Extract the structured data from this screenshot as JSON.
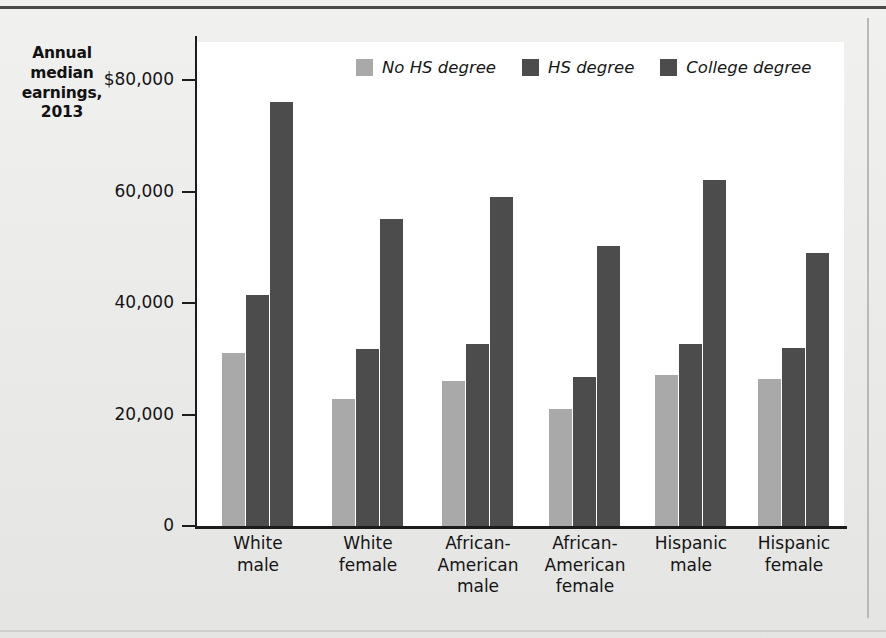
{
  "axis_title": "Annual median earnings, 2013",
  "axis_title_lines": [
    "Annual",
    "median",
    "earnings,",
    "2013"
  ],
  "colors": {
    "no_hs": "#a9a9a9",
    "hs": "#4c4c4c",
    "college": "#4c4c4c",
    "axis": "#1c1c1c",
    "panel": "#ffffff",
    "page": "#e9e9e7"
  },
  "legend": {
    "items": [
      {
        "label": "No HS degree",
        "color": "#a9a9a9"
      },
      {
        "label": "HS degree",
        "color": "#4c4c4c"
      },
      {
        "label": "College degree",
        "color": "#4c4c4c"
      }
    ]
  },
  "y_axis": {
    "ticks": [
      {
        "value": 80000,
        "label": "$80,000"
      },
      {
        "value": 60000,
        "label": "60,000"
      },
      {
        "value": 40000,
        "label": "40,000"
      },
      {
        "value": 20000,
        "label": "20,000"
      },
      {
        "value": 0,
        "label": "0"
      }
    ],
    "min": 0,
    "max": 80000
  },
  "x_axis": {
    "categories": [
      {
        "lines": [
          "White",
          "male"
        ]
      },
      {
        "lines": [
          "White",
          "female"
        ]
      },
      {
        "lines": [
          "African-",
          "American",
          "male"
        ]
      },
      {
        "lines": [
          "African-",
          "American",
          "female"
        ]
      },
      {
        "lines": [
          "Hispanic",
          "male"
        ]
      },
      {
        "lines": [
          "Hispanic",
          "female"
        ]
      }
    ]
  },
  "chart_data": {
    "type": "bar",
    "title": "",
    "xlabel": "",
    "ylabel": "Annual median earnings, 2013",
    "ylim": [
      0,
      80000
    ],
    "grid": false,
    "legend_position": "top-center",
    "categories": [
      "White male",
      "White female",
      "African-American male",
      "African-American female",
      "Hispanic male",
      "Hispanic female"
    ],
    "series": [
      {
        "name": "No HS degree",
        "color": "#a9a9a9",
        "values": [
          31000,
          22800,
          26000,
          21000,
          27000,
          26300
        ]
      },
      {
        "name": "HS degree",
        "color": "#4c4c4c",
        "values": [
          41500,
          31800,
          32700,
          26700,
          32600,
          32000
        ]
      },
      {
        "name": "College degree",
        "color": "#4c4c4c",
        "values": [
          76000,
          55000,
          59000,
          50200,
          62000,
          49000
        ]
      }
    ],
    "ytick_labels": [
      "0",
      "20,000",
      "40,000",
      "60,000",
      "$80,000"
    ],
    "ytick_values": [
      0,
      20000,
      40000,
      60000,
      80000
    ]
  }
}
